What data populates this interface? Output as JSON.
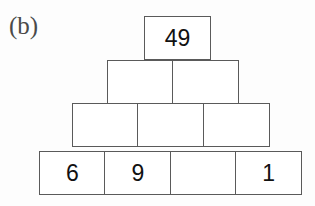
{
  "panel": {
    "label": "(b)"
  },
  "colors": {
    "background": "#fdfdfd",
    "cell_fill": "#ffffff",
    "border": "#5a5a5a",
    "digit": "#111111",
    "label": "#4a4a4a"
  },
  "pyramid": {
    "rows": [
      {
        "index": 1,
        "cells": [
          {
            "value": "49"
          }
        ]
      },
      {
        "index": 2,
        "cells": [
          {
            "value": ""
          },
          {
            "value": ""
          }
        ]
      },
      {
        "index": 3,
        "cells": [
          {
            "value": ""
          },
          {
            "value": ""
          },
          {
            "value": ""
          }
        ]
      },
      {
        "index": 4,
        "cells": [
          {
            "value": "6"
          },
          {
            "value": "9"
          },
          {
            "value": ""
          },
          {
            "value": "1"
          }
        ]
      }
    ]
  },
  "chart_data": {
    "type": "table",
    "title": "(b)",
    "rows": [
      {
        "row": 1,
        "values": [
          "49"
        ]
      },
      {
        "row": 2,
        "values": [
          "",
          ""
        ]
      },
      {
        "row": 3,
        "values": [
          "",
          "",
          ""
        ]
      },
      {
        "row": 4,
        "values": [
          "6",
          "9",
          "",
          "1"
        ]
      }
    ],
    "filled_values": {
      "apex": 49,
      "base_1": 6,
      "base_2": 9,
      "base_3": null,
      "base_4": 1
    },
    "cell_count": 10,
    "grid": false,
    "xlabel": "",
    "ylabel": ""
  }
}
